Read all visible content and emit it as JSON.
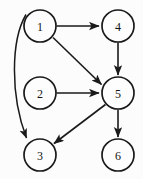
{
  "diagram": {
    "background_color": "#fcfcfc",
    "stroke_color": "#1a1a1a",
    "node_fill_color": "#fdfdfd",
    "node_radius": 16,
    "nodes": [
      {
        "id": "1",
        "label": "1",
        "cx": 40,
        "cy": 26
      },
      {
        "id": "2",
        "label": "2",
        "cx": 40,
        "cy": 93
      },
      {
        "id": "3",
        "label": "3",
        "cx": 40,
        "cy": 155
      },
      {
        "id": "4",
        "label": "4",
        "cx": 118,
        "cy": 26
      },
      {
        "id": "5",
        "label": "5",
        "cx": 118,
        "cy": 93
      },
      {
        "id": "6",
        "label": "6",
        "cx": 118,
        "cy": 155
      }
    ],
    "edges": [
      {
        "id": "e1",
        "from": "1",
        "to": "4",
        "shape": "straight",
        "directed": true
      },
      {
        "id": "e2",
        "from": "1",
        "to": "5",
        "shape": "straight",
        "directed": true
      },
      {
        "id": "e3",
        "from": "1",
        "to": "3",
        "shape": "curved",
        "directed": true
      },
      {
        "id": "e4",
        "from": "2",
        "to": "5",
        "shape": "straight",
        "directed": true
      },
      {
        "id": "e5",
        "from": "4",
        "to": "5",
        "shape": "straight",
        "directed": true
      },
      {
        "id": "e6",
        "from": "5",
        "to": "3",
        "shape": "straight",
        "directed": true
      },
      {
        "id": "e7",
        "from": "5",
        "to": "6",
        "shape": "straight",
        "directed": true
      }
    ]
  }
}
